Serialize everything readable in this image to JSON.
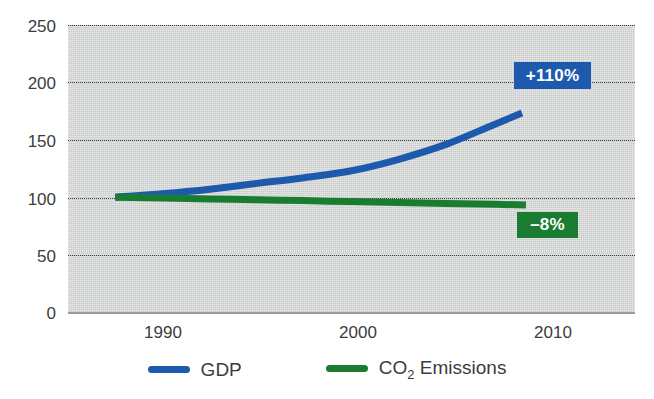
{
  "chart_data": {
    "type": "line",
    "title": "",
    "subtitle": "",
    "xlabel": "",
    "ylabel": "",
    "xlim": [
      1988,
      2012
    ],
    "ylim": [
      0,
      250
    ],
    "x_ticks": [
      "1990",
      "2000",
      "2010"
    ],
    "x_tick_values": [
      1990,
      2000,
      2010
    ],
    "y_ticks": [
      "250",
      "200",
      "150",
      "100",
      "50",
      "0"
    ],
    "y_tick_values": [
      250,
      200,
      150,
      100,
      50,
      0
    ],
    "grid": true,
    "grid_style": "dotted-horizontal",
    "legend_position": "bottom",
    "index_base_note": "Index 1990 = 100",
    "series": [
      {
        "name": "GDP",
        "color": "#1d5aad",
        "x": [
          1990,
          1992,
          1994,
          1996,
          1998,
          2000,
          2002,
          2004,
          2006,
          2008,
          2010
        ],
        "values": [
          100,
          103,
          107,
          112,
          117,
          123,
          133,
          146,
          163,
          185,
          210
        ],
        "end_label": "+110%"
      },
      {
        "name": "CO2 Emissions",
        "color": "#1a7c31",
        "x": [
          1990,
          1992,
          1994,
          1996,
          1998,
          2000,
          2002,
          2004,
          2006,
          2008,
          2010
        ],
        "values": [
          100,
          99.2,
          98.5,
          97.8,
          97.0,
          96.2,
          95.4,
          94.6,
          93.8,
          93.0,
          92
        ],
        "end_label": "-8%"
      }
    ]
  },
  "axes": {
    "y_labels": [
      "250",
      "200",
      "150",
      "100",
      "50",
      "0"
    ],
    "x_labels": [
      "1990",
      "2000",
      "2010"
    ]
  },
  "callouts": {
    "gdp": "+110%",
    "co2": "–8%"
  },
  "legend": {
    "items": [
      {
        "label": "GDP",
        "sub": "",
        "tail": "",
        "color": "#1d5aad"
      },
      {
        "label": "CO",
        "sub": "2",
        "tail": " Emissions",
        "color": "#1a7c31"
      }
    ]
  },
  "colors": {
    "gdp_blue": "#1d5aad",
    "co2_green": "#1a7c31",
    "plot_background": "#d5d7d7",
    "grid": "#3a3a3a",
    "text": "#3c3c3c",
    "page_background": "#ffffff"
  }
}
